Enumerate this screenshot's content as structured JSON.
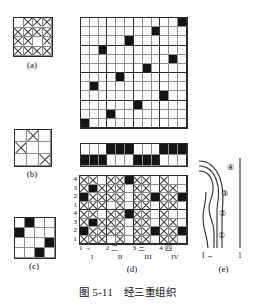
{
  "figure": {
    "title": "图 5-11　经三重组织",
    "title_number": "图 5-11",
    "title_text": "经三重组织"
  },
  "subfigures": {
    "a": {
      "caption": "(a)",
      "type": "weave-grid",
      "rows": 4,
      "cols": 4,
      "mark": "cross",
      "cells": [
        [
          0,
          1,
          1,
          1
        ],
        [
          1,
          1,
          1,
          1
        ],
        [
          1,
          1,
          0,
          1
        ],
        [
          1,
          1,
          1,
          1
        ]
      ]
    },
    "b": {
      "caption": "(b)",
      "type": "weave-grid",
      "rows": 3,
      "cols": 3,
      "mark": "cross",
      "cells": [
        [
          0,
          1,
          0
        ],
        [
          1,
          0,
          0
        ],
        [
          0,
          0,
          1
        ]
      ]
    },
    "c": {
      "caption": "(c)",
      "type": "weave-grid",
      "rows": 4,
      "cols": 4,
      "mark": "fill",
      "cells": [
        [
          0,
          1,
          0,
          0
        ],
        [
          1,
          0,
          0,
          0
        ],
        [
          0,
          0,
          0,
          1
        ],
        [
          0,
          0,
          1,
          0
        ]
      ]
    },
    "big": {
      "caption": "",
      "type": "weave-grid",
      "rows": 12,
      "cols": 12,
      "mark": "fill",
      "cells": [
        [
          0,
          0,
          0,
          0,
          0,
          0,
          0,
          0,
          0,
          0,
          0,
          1
        ],
        [
          0,
          0,
          0,
          0,
          0,
          0,
          0,
          0,
          1,
          0,
          0,
          0
        ],
        [
          0,
          0,
          0,
          0,
          0,
          1,
          0,
          0,
          0,
          0,
          0,
          0
        ],
        [
          0,
          0,
          1,
          0,
          0,
          0,
          0,
          0,
          0,
          0,
          0,
          0
        ],
        [
          0,
          0,
          0,
          0,
          0,
          0,
          0,
          0,
          0,
          0,
          1,
          0
        ],
        [
          0,
          0,
          0,
          0,
          0,
          0,
          0,
          1,
          0,
          0,
          0,
          0
        ],
        [
          0,
          0,
          0,
          0,
          1,
          0,
          0,
          0,
          0,
          0,
          0,
          0
        ],
        [
          0,
          1,
          0,
          0,
          0,
          0,
          0,
          0,
          0,
          0,
          0,
          0
        ],
        [
          0,
          0,
          0,
          0,
          0,
          0,
          0,
          0,
          0,
          1,
          0,
          0
        ],
        [
          0,
          0,
          0,
          0,
          0,
          0,
          1,
          0,
          0,
          0,
          0,
          0
        ],
        [
          0,
          0,
          0,
          1,
          0,
          0,
          0,
          0,
          0,
          0,
          0,
          0
        ],
        [
          1,
          0,
          0,
          0,
          0,
          0,
          0,
          0,
          0,
          0,
          0,
          0
        ]
      ]
    },
    "strip": {
      "caption": "",
      "type": "weave-grid",
      "rows": 2,
      "cols": 12,
      "mark": "fill",
      "cells": [
        [
          0,
          0,
          0,
          1,
          1,
          1,
          0,
          0,
          0,
          1,
          1,
          1
        ],
        [
          1,
          1,
          1,
          0,
          0,
          0,
          1,
          1,
          1,
          0,
          0,
          0
        ]
      ]
    },
    "d": {
      "caption": "(d)",
      "type": "weave-grid-mixed",
      "rows": 8,
      "cols": 12,
      "row_labels": [
        "4",
        "3",
        "2",
        "1",
        "4",
        "3",
        "2",
        "1"
      ],
      "col_labels_top": [
        "1 →",
        "2 二",
        "3 三",
        "4 四"
      ],
      "col_labels_bottom": [
        "I",
        "II",
        "III",
        "IV"
      ],
      "cells": [
        [
          "x",
          "x",
          "0",
          "x",
          "x",
          "f",
          "x",
          "x",
          "0",
          "x",
          "0",
          "0"
        ],
        [
          "x",
          "f",
          "x",
          "x",
          "x",
          "0",
          "x",
          "x",
          "0",
          "x",
          "x",
          "0"
        ],
        [
          "f",
          "x",
          "x",
          "x",
          "x",
          "0",
          "x",
          "x",
          "f",
          "x",
          "x",
          "f"
        ],
        [
          "x",
          "x",
          "x",
          "0",
          "x",
          "0",
          "x",
          "x",
          "0",
          "x",
          "x",
          "0"
        ],
        [
          "x",
          "x",
          "0",
          "x",
          "x",
          "f",
          "x",
          "x",
          "0",
          "x",
          "0",
          "0"
        ],
        [
          "x",
          "f",
          "x",
          "x",
          "x",
          "0",
          "x",
          "x",
          "0",
          "x",
          "x",
          "0"
        ],
        [
          "f",
          "x",
          "x",
          "x",
          "x",
          "0",
          "x",
          "x",
          "f",
          "x",
          "x",
          "f"
        ],
        [
          "x",
          "x",
          "x",
          "0",
          "x",
          "0",
          "x",
          "x",
          "0",
          "x",
          "x",
          "0"
        ]
      ]
    },
    "e": {
      "caption": "(e)",
      "type": "yarn-cross-section",
      "thread_labels": [
        "①",
        "②",
        "③",
        "④"
      ],
      "base_left": "I →",
      "base_right": "1"
    }
  }
}
